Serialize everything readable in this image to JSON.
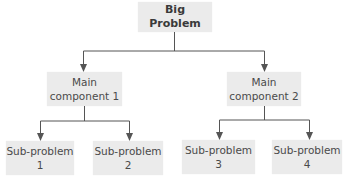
{
  "diagram": {
    "type": "hierarchy-tree",
    "root": {
      "label": "Big Problem"
    },
    "main_components": [
      {
        "line1": "Main",
        "line2": "component 1",
        "children": [
          {
            "line1": "Sub-problem",
            "line2": "1"
          },
          {
            "line1": "Sub-problem",
            "line2": "2"
          }
        ]
      },
      {
        "line1": "Main",
        "line2": "component 2",
        "children": [
          {
            "line1": "Sub-problem",
            "line2": "3"
          },
          {
            "line1": "Sub-problem",
            "line2": "4"
          }
        ]
      }
    ],
    "colors": {
      "node_fill": "#ebebeb",
      "connector": "#555555",
      "text": "#4a4a4a"
    }
  }
}
